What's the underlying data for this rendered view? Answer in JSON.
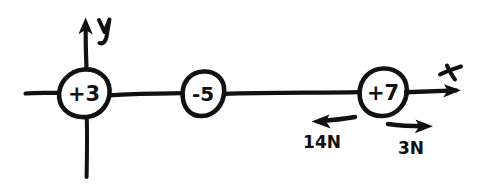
{
  "diagram": {
    "style": "hand-drawn sketch, black ink on white paper",
    "background_color": "#ffffff",
    "ink_color": "#111111",
    "axes": {
      "x_label": "x",
      "y_label": "y",
      "x_axis_description": "horizontal line running left to right through all three charges, arrowhead at right end",
      "y_axis_description": "vertical line through the +3 charge, arrowhead at top end"
    },
    "nodes": [
      {
        "id": "node-charge-1",
        "label": "+3",
        "cx": 84,
        "cy": 93,
        "rx": 25,
        "ry": 24
      },
      {
        "id": "node-charge-2",
        "label": "-5",
        "cx": 203,
        "cy": 93,
        "rx": 21,
        "ry": 22
      },
      {
        "id": "node-charge-3",
        "label": "+7",
        "cx": 383,
        "cy": 92,
        "rx": 24,
        "ry": 24
      }
    ],
    "force_vectors": [
      {
        "id": "force-left",
        "label": "14N",
        "direction": "left",
        "label_x": 322,
        "label_y": 146
      },
      {
        "id": "force-right",
        "label": "3N",
        "direction": "right",
        "label_x": 411,
        "label_y": 152
      }
    ]
  }
}
